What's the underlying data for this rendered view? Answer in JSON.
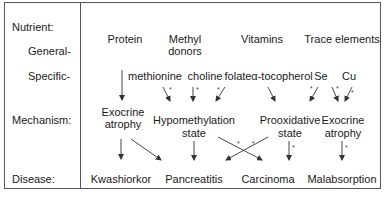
{
  "row_labels": {
    "nutrient": "Nutrient:",
    "general": "General-",
    "specific": "Specific-",
    "mechanism": "Mechanism:",
    "disease": "Disease:"
  },
  "general": {
    "protein": "Protein",
    "methyl_1": "Methyl",
    "methyl_2": "donors",
    "vitamins": "Vitamins",
    "trace": "Trace elements"
  },
  "specific": {
    "methionine": "methionine",
    "choline": "choline",
    "folate": "folate",
    "tocopherol": "α-tocopherol",
    "se": "Se",
    "cu": "Cu"
  },
  "mechanism": {
    "exocrine1_1": "Exocrine",
    "exocrine1_2": "atrophy",
    "hypo_1": "Hypomethylation",
    "hypo_2": "state",
    "proox_1": "Prooxidative",
    "proox_2": "state",
    "exocrine2_1": "Exocrine",
    "exocrine2_2": "atrophy"
  },
  "disease": {
    "kwashiorkor": "Kwashiorkor",
    "pancreatitis": "Pancreatitis",
    "carcinoma": "Carcinoma",
    "malabsorption": "Malabsorption"
  },
  "annotation_mark": "*",
  "colors": {
    "line": "#333333",
    "border": "#555555",
    "text": "#1a1a1a"
  }
}
